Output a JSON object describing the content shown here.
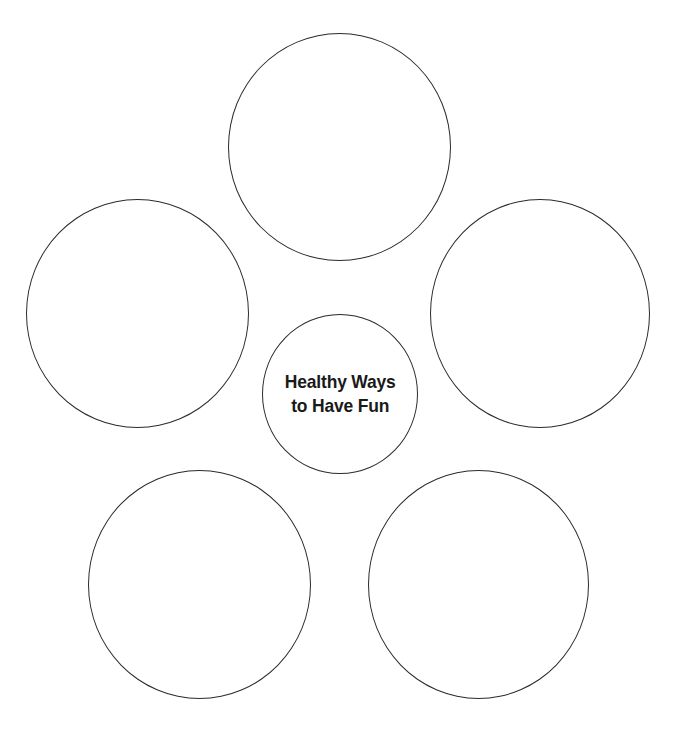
{
  "diagram": {
    "type": "bubble-map",
    "center": {
      "lines": [
        "Healthy Ways",
        "to Have Fun"
      ],
      "text": "Healthy Ways to Have Fun"
    },
    "bubbles": [
      {
        "position": "top",
        "text": ""
      },
      {
        "position": "left",
        "text": ""
      },
      {
        "position": "right",
        "text": ""
      },
      {
        "position": "bottom-left",
        "text": ""
      },
      {
        "position": "bottom-right",
        "text": ""
      }
    ],
    "colors": {
      "stroke": "#2b2b2b",
      "background": "#ffffff",
      "text": "#1a1a1a"
    }
  }
}
